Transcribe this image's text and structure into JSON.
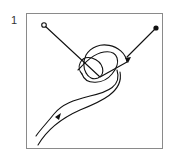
{
  "figure": {
    "label": "1",
    "frame_color": "#8a8a8a",
    "stroke_color": "#111111"
  }
}
